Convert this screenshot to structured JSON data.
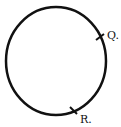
{
  "diagram": {
    "shape": "circle",
    "stroke_color": "#111111",
    "background": "#ffffff",
    "points": [
      {
        "label": "Q.",
        "position": "right-upper"
      },
      {
        "label": "R.",
        "position": "bottom-right"
      }
    ]
  }
}
